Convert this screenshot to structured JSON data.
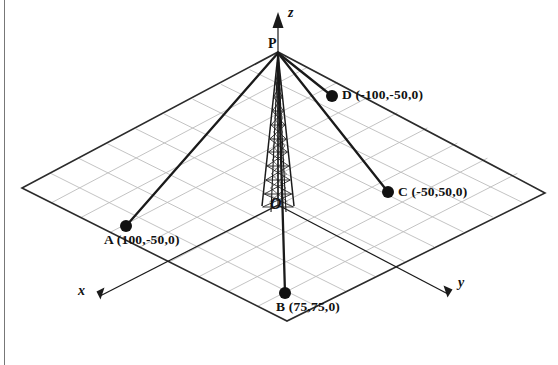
{
  "figure": {
    "type": "3d-diagram",
    "background_color": "#ffffff",
    "line_color": "#1a1a1a",
    "grid_color": "#b9b9b9",
    "plane_edge_color": "#2b2b2b"
  },
  "axes": [
    {
      "id": "x",
      "label": "x",
      "label_x": 78,
      "label_y": 284,
      "italic": true
    },
    {
      "id": "y",
      "label": "y",
      "label_x": 458,
      "label_y": 276,
      "italic": true
    },
    {
      "id": "z",
      "label": "z",
      "label_x": 288,
      "label_y": 6,
      "italic": true
    }
  ],
  "apex": {
    "name": "P",
    "label": "P",
    "label_x": 268,
    "label_y": 37,
    "px": 278,
    "py": 52
  },
  "origin": {
    "name": "O",
    "label": "O",
    "label_x": 270,
    "label_y": 196,
    "px": 278,
    "py": 205
  },
  "points": [
    {
      "id": "A",
      "label": "A (100,-50,0)",
      "name": "A",
      "coordinates": [
        100,
        -50,
        0
      ],
      "px": 126,
      "py": 226,
      "label_x": 104,
      "label_y": 233
    },
    {
      "id": "B",
      "label": "B (75,75,0)",
      "name": "B",
      "coordinates": [
        75,
        75,
        0
      ],
      "px": 285,
      "py": 293,
      "label_x": 276,
      "label_y": 300
    },
    {
      "id": "C",
      "label": "C (-50,50,0)",
      "name": "C",
      "coordinates": [
        -50,
        50,
        0
      ],
      "px": 388,
      "py": 192,
      "label_x": 398,
      "label_y": 185
    },
    {
      "id": "D",
      "label": "D (-100,-50,0)",
      "name": "D",
      "coordinates": [
        -100,
        -50,
        0
      ],
      "px": 332,
      "py": 96,
      "label_x": 342,
      "label_y": 88
    }
  ],
  "ground_plane": {
    "left_corner": [
      22,
      188
    ],
    "bottom_corner": [
      287,
      321
    ],
    "right_corner": [
      545,
      193
    ],
    "top_corner": [
      278,
      52
    ],
    "grid_divisions": 9
  }
}
